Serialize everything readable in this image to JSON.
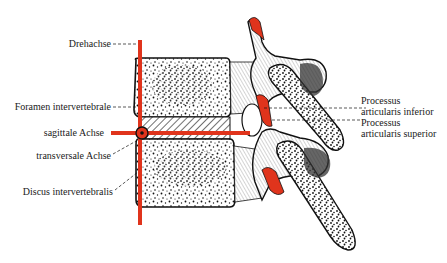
{
  "diagram": {
    "accent_color": "#e0341c",
    "line_color": "#111111",
    "labels_left": [
      {
        "id": "drehachse",
        "text": "Drehachse"
      },
      {
        "id": "foramen",
        "text": "Foramen intervertebrale"
      },
      {
        "id": "sagittal",
        "text": "sagittale Achse"
      },
      {
        "id": "transversal",
        "text": "transversale Achse"
      },
      {
        "id": "discus",
        "text": "Discus intervertebralis"
      }
    ],
    "labels_right": [
      {
        "id": "proc-inf",
        "line1": "Processus",
        "line2": "articularis inferior"
      },
      {
        "id": "proc-sup",
        "line1": "Processus",
        "line2": "articularis superior"
      }
    ],
    "axes": [
      {
        "name": "Drehachse",
        "orientation": "vertical",
        "color": "#e0341c"
      },
      {
        "name": "sagittale Achse",
        "orientation": "horizontal",
        "color": "#e0341c"
      },
      {
        "name": "transversale Achse",
        "orientation": "point (circle)",
        "color": "#111111"
      }
    ]
  }
}
